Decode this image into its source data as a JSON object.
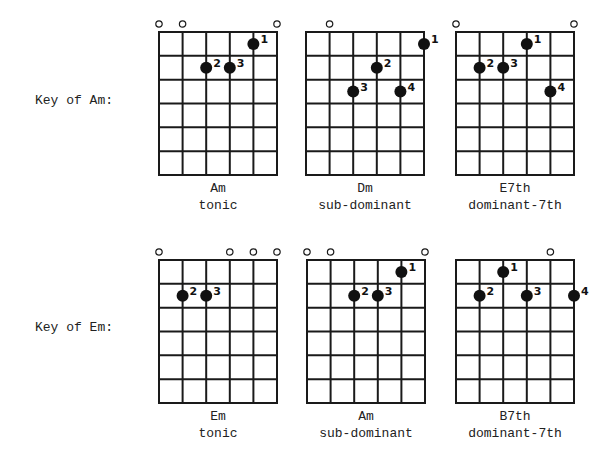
{
  "rows": [
    {
      "key_label": "Key of Am:",
      "chords": [
        {
          "name": "Am",
          "function": "tonic",
          "open_strings": [
            1,
            2,
            6
          ],
          "fingers": [
            {
              "string": 5,
              "fret": 1,
              "finger": "1"
            },
            {
              "string": 3,
              "fret": 2,
              "finger": "2"
            },
            {
              "string": 4,
              "fret": 2,
              "finger": "3"
            }
          ]
        },
        {
          "name": "Dm",
          "function": "sub-dominant",
          "open_strings": [
            2
          ],
          "fingers": [
            {
              "string": 6,
              "fret": 1,
              "finger": "1"
            },
            {
              "string": 4,
              "fret": 2,
              "finger": "2"
            },
            {
              "string": 3,
              "fret": 3,
              "finger": "3"
            },
            {
              "string": 5,
              "fret": 3,
              "finger": "4"
            }
          ]
        },
        {
          "name": "E7th",
          "function": "dominant-7th",
          "open_strings": [
            1,
            6
          ],
          "fingers": [
            {
              "string": 4,
              "fret": 1,
              "finger": "1"
            },
            {
              "string": 2,
              "fret": 2,
              "finger": "2"
            },
            {
              "string": 3,
              "fret": 2,
              "finger": "3"
            },
            {
              "string": 5,
              "fret": 3,
              "finger": "4"
            }
          ]
        }
      ]
    },
    {
      "key_label": "Key of Em:",
      "chords": [
        {
          "name": "Em",
          "function": "tonic",
          "open_strings": [
            1,
            4,
            5,
            6
          ],
          "fingers": [
            {
              "string": 2,
              "fret": 2,
              "finger": "2"
            },
            {
              "string": 3,
              "fret": 2,
              "finger": "3"
            }
          ]
        },
        {
          "name": "Am",
          "function": "sub-dominant",
          "open_strings": [
            1,
            2,
            6
          ],
          "fingers": [
            {
              "string": 5,
              "fret": 1,
              "finger": "1"
            },
            {
              "string": 3,
              "fret": 2,
              "finger": "2"
            },
            {
              "string": 4,
              "fret": 2,
              "finger": "3"
            }
          ]
        },
        {
          "name": "B7th",
          "function": "dominant-7th",
          "open_strings": [
            5
          ],
          "fingers": [
            {
              "string": 3,
              "fret": 1,
              "finger": "1"
            },
            {
              "string": 2,
              "fret": 2,
              "finger": "2"
            },
            {
              "string": 4,
              "fret": 2,
              "finger": "3"
            },
            {
              "string": 6,
              "fret": 2,
              "finger": "4"
            }
          ]
        }
      ]
    }
  ],
  "grid": {
    "strings": 6,
    "frets": 6
  },
  "colors": {
    "line": "#1a1a1a",
    "dot": "#111111",
    "background": "#ffffff"
  }
}
